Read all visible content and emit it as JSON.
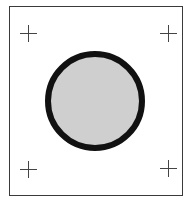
{
  "diagram": {
    "frame": {
      "stroke": "#3a3a3a"
    },
    "circle": {
      "cx": 95,
      "cy": 101,
      "r": 47,
      "stroke_width": 6,
      "fill": "#cfcfcf",
      "stroke": "#111111"
    },
    "registration_marks": [
      {
        "name": "top-left",
        "x": 28,
        "y": 33
      },
      {
        "name": "top-right",
        "x": 168,
        "y": 33
      },
      {
        "name": "bottom-left",
        "x": 28,
        "y": 169
      },
      {
        "name": "bottom-right",
        "x": 168,
        "y": 168
      }
    ]
  }
}
